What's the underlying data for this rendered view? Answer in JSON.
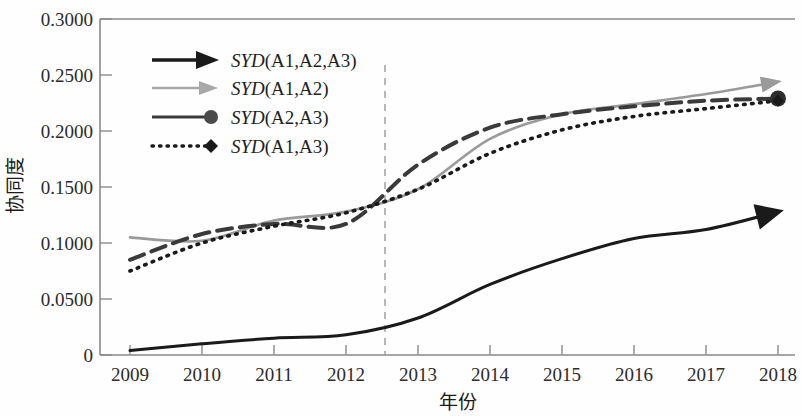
{
  "figure": {
    "background": "#fefefe",
    "ink": "#1a1a1a"
  },
  "axes": {
    "y_label": "协同度",
    "x_label": "年份",
    "y_ticks": [
      "0",
      "0.0500",
      "0.1000",
      "0.1500",
      "0.2000",
      "0.2500",
      "0.3000"
    ],
    "x_ticks": [
      "2009",
      "2010",
      "2011",
      "2012",
      "2013",
      "2014",
      "2015",
      "2016",
      "2017",
      "2018"
    ]
  },
  "legend": {
    "items": [
      {
        "prefix": "SYD",
        "args": "(A1,A2,A3)",
        "marker": "arrow",
        "color": "#1a1a1a",
        "style": "solid"
      },
      {
        "prefix": "SYD",
        "args": "(A1,A2)",
        "marker": "arrow",
        "color": "#9a9a9a",
        "style": "solid"
      },
      {
        "prefix": "SYD",
        "args": "(A2,A3)",
        "marker": "circle",
        "color": "#3a3a3a",
        "style": "solid"
      },
      {
        "prefix": "SYD",
        "args": "(A1,A3)",
        "marker": "diamond",
        "color": "#1a1a1a",
        "style": "dotted"
      }
    ]
  },
  "annotations": {
    "divider_year": "2012.5",
    "divider_style": "dashed-vertical"
  },
  "chart_data": {
    "type": "line",
    "title": "",
    "xlabel": "年份",
    "ylabel": "协同度",
    "xlim": [
      2009,
      2018
    ],
    "ylim": [
      0,
      0.3
    ],
    "grid": false,
    "legend_position": "upper-left",
    "x": [
      2009,
      2010,
      2011,
      2012,
      2013,
      2014,
      2015,
      2016,
      2017,
      2018
    ],
    "annotations": [
      {
        "type": "vline",
        "x": 2012.5,
        "style": "dashed",
        "color": "#808080"
      }
    ],
    "series": [
      {
        "name": "SYD(A1,A2,A3)",
        "color": "#1a1a1a",
        "style": "solid",
        "end_marker": "arrow",
        "values": [
          0.004,
          0.01,
          0.015,
          0.018,
          0.033,
          0.063,
          0.086,
          0.104,
          0.112,
          0.128
        ]
      },
      {
        "name": "SYD(A1,A2)",
        "color": "#9a9a9a",
        "style": "solid",
        "end_marker": "arrow",
        "values": [
          0.105,
          0.102,
          0.12,
          0.128,
          0.148,
          0.193,
          0.215,
          0.224,
          0.233,
          0.244
        ]
      },
      {
        "name": "SYD(A2,A3)",
        "color": "#3a3a3a",
        "style": "dashed",
        "end_marker": "circle",
        "values": [
          0.085,
          0.108,
          0.117,
          0.117,
          0.17,
          0.203,
          0.215,
          0.222,
          0.227,
          0.229
        ]
      },
      {
        "name": "SYD(A1,A3)",
        "color": "#1a1a1a",
        "style": "dotted",
        "end_marker": "diamond",
        "values": [
          0.075,
          0.1,
          0.115,
          0.127,
          0.148,
          0.18,
          0.201,
          0.213,
          0.22,
          0.227
        ]
      }
    ]
  }
}
